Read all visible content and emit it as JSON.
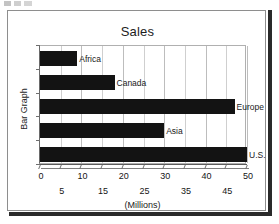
{
  "figure": {
    "title": "Sales",
    "ylabel": "Bar Graph",
    "xlabel": "(Millions)"
  },
  "chart_data": {
    "type": "bar",
    "orientation": "horizontal",
    "title": "Sales",
    "xlabel": "(Millions)",
    "ylabel": "Bar Graph",
    "categories": [
      "Africa",
      "Canada",
      "Europe",
      "Asia",
      "U.S."
    ],
    "values": [
      9,
      18,
      47,
      30,
      50
    ],
    "xlim": [
      0,
      50
    ],
    "xticks": [
      0,
      5,
      10,
      15,
      20,
      25,
      30,
      35,
      40,
      45,
      50
    ],
    "xticklabels": [
      "0",
      "5",
      "10",
      "15",
      "20",
      "25",
      "30",
      "35",
      "40",
      "45",
      "50"
    ],
    "xtick_rows": {
      "top": [
        "0",
        "10",
        "20",
        "30",
        "40",
        "50"
      ],
      "bottom": [
        "5",
        "15",
        "25",
        "35",
        "45"
      ]
    },
    "grid": true,
    "grid_axis": "x",
    "legend": "none",
    "bar_color": "#131313",
    "bar_labels_inline": true
  },
  "axis": {
    "ticks_top": [
      {
        "label": "0",
        "value": 0
      },
      {
        "label": "10",
        "value": 10
      },
      {
        "label": "20",
        "value": 20
      },
      {
        "label": "30",
        "value": 30
      },
      {
        "label": "40",
        "value": 40
      },
      {
        "label": "50",
        "value": 50
      }
    ],
    "ticks_bottom": [
      {
        "label": "5",
        "value": 5
      },
      {
        "label": "15",
        "value": 15
      },
      {
        "label": "25",
        "value": 25
      },
      {
        "label": "35",
        "value": 35
      },
      {
        "label": "45",
        "value": 45
      }
    ]
  },
  "bars": [
    {
      "label": "Africa",
      "value": 9
    },
    {
      "label": "Canada",
      "value": 18
    },
    {
      "label": "Europe",
      "value": 47
    },
    {
      "label": "Asia",
      "value": 30
    },
    {
      "label": "U.S.",
      "value": 50
    }
  ],
  "colors": {
    "bar": "#131313",
    "grid": "#cfcfcf",
    "frame": "#8e8e8e",
    "shadow": "#2a2a2a",
    "text": "#1a1a1a"
  }
}
